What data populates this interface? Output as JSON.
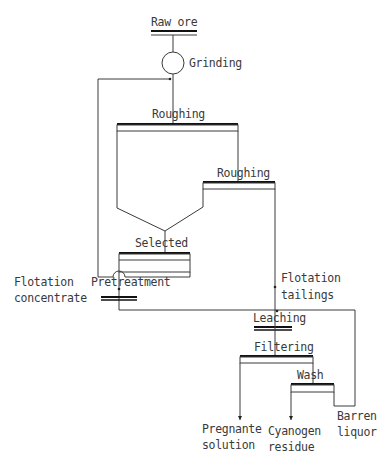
{
  "diagram": {
    "type": "process-flowchart",
    "colors": {
      "line": "#3a3a3a",
      "bar": "#111111",
      "text": "#3a3a3a",
      "background": "#ffffff"
    },
    "nodes": {
      "raw_ore": "Raw ore",
      "grinding": "Grinding",
      "roughing_1": "Roughing",
      "roughing_2": "Roughing",
      "selected": "Selected",
      "pretreatment": "Pretreatment",
      "leaching": "Leaching",
      "filtering": "Filtering",
      "wash": "Wash"
    },
    "streams": {
      "flotation_concentrate_line1": "Flotation",
      "flotation_concentrate_line2": "concentrate",
      "flotation_tailings_line1": "Flotation",
      "flotation_tailings_line2": "tailings",
      "pregnant_solution_line1": "Pregnante",
      "pregnant_solution_line2": "solution",
      "cyanogen_residue_line1": "Cyanogen",
      "cyanogen_residue_line2": "residue",
      "barren_liquor_line1": "Barren",
      "barren_liquor_line2": "liquor"
    },
    "edges": [
      {
        "from": "Raw ore",
        "to": "Grinding"
      },
      {
        "from": "Grinding",
        "to": "Roughing"
      },
      {
        "from": "Roughing",
        "to": "Roughing (2)"
      },
      {
        "from": "Roughing",
        "to": "Selected"
      },
      {
        "from": "Roughing (2)",
        "to": "Selected"
      },
      {
        "from": "Selected",
        "to": "Grinding",
        "note": "recycle"
      },
      {
        "from": "Selected",
        "to": "Pretreatment"
      },
      {
        "from": "Roughing (2)",
        "to": "Leaching",
        "note": "Flotation tailings"
      },
      {
        "from": "Pretreatment",
        "to": "Leaching"
      },
      {
        "from": "Leaching",
        "to": "Filtering"
      },
      {
        "from": "Filtering",
        "to": "Pregnante solution"
      },
      {
        "from": "Filtering",
        "to": "Wash"
      },
      {
        "from": "Wash",
        "to": "Cyanogen residue"
      },
      {
        "from": "Wash",
        "to": "Barren liquor"
      },
      {
        "from": "Barren liquor",
        "to": "Leaching",
        "note": "recycle"
      }
    ]
  }
}
